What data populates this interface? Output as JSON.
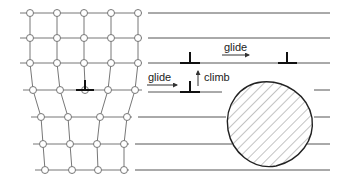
{
  "figure": {
    "labels": {
      "glide_top": "glide",
      "glide_left": "glide",
      "climb": "climb"
    },
    "colors": {
      "line": "#555555",
      "atom_stroke": "#777777",
      "dislocation": "#111111",
      "precipitate_outline": "#222222",
      "hatch": "#888888"
    },
    "lattice": {
      "rows": [
        {
          "y": 13,
          "atoms_x": [
            30,
            57,
            84,
            111,
            138
          ],
          "line_start": 20,
          "line_end": 330
        },
        {
          "y": 38,
          "atoms_x": [
            30,
            57,
            84,
            111,
            138
          ],
          "line_start": 20,
          "line_end": 330
        },
        {
          "y": 63,
          "atoms_x": [
            30,
            57,
            84,
            111,
            138
          ],
          "line_start": 20,
          "line_end": 330
        },
        {
          "y": 90,
          "atoms_x": [
            33,
            60,
            108,
            135
          ],
          "line_start": 23,
          "line_end": 330
        },
        {
          "y": 117,
          "atoms_x": [
            41,
            68,
            100,
            127
          ],
          "line_start": 31,
          "line_end": 330
        },
        {
          "y": 144,
          "atoms_x": [
            43,
            70,
            97,
            124
          ],
          "line_start": 33,
          "line_end": 330
        },
        {
          "y": 170,
          "atoms_x": [
            45,
            72,
            98,
            124
          ],
          "line_start": 35,
          "line_end": 330
        }
      ]
    },
    "dislocations": [
      {
        "name": "lattice-core",
        "x": 85,
        "y": 90
      },
      {
        "name": "before-climb",
        "x": 190,
        "y": 92
      },
      {
        "name": "after-climb",
        "x": 190,
        "y": 63
      },
      {
        "name": "after-glide",
        "x": 287,
        "y": 63
      }
    ],
    "precipitate": {
      "cx": 270,
      "cy": 125,
      "r": 42
    }
  }
}
